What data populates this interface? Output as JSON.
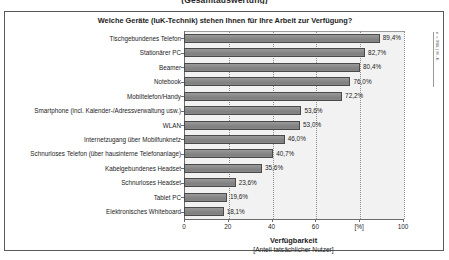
{
  "page": {
    "cut_off_heading": "(Gesamtauswertung)"
  },
  "side_note": "n = 986 | H.-K.",
  "axis_caption": {
    "main": "Verfügbarkeit",
    "sub": "[Anteil tatsächlicher Nutzer]"
  },
  "chart_data": {
    "type": "bar",
    "orientation": "horizontal",
    "title": "Welche Geräte (IuK-Technik) stehen Ihnen für Ihre Arbeit zur Verfügung?",
    "xlabel": "Verfügbarkeit",
    "xlabel_sub": "[Anteil tatsächlicher Nutzer]",
    "ylabel": "",
    "xlim": [
      0,
      100
    ],
    "xticks": [
      0,
      20,
      40,
      60,
      80,
      100
    ],
    "xtick_labels": [
      "0",
      "20",
      "40",
      "60",
      "[%]",
      "100"
    ],
    "grid": true,
    "legend": false,
    "unit": "%",
    "categories": [
      "Tischgebundenes Telefon",
      "Stationärer PC",
      "Beamer",
      "Notebook",
      "Mobiltelefon/Handy",
      "Smartphone (incl. Kalender-/Adressverwaltung usw.)",
      "WLAN",
      "Internetzugang über Mobilfunknetz",
      "Schnurloses Telefon (über hausinterne Telefonanlage)",
      "Kabelgebundenes Headset",
      "Schnurloses Headset",
      "Tablet PC",
      "Elektronisches Whiteboard"
    ],
    "values": [
      89.4,
      82.7,
      80.4,
      76.0,
      72.2,
      53.6,
      53.0,
      46.0,
      40.7,
      35.6,
      23.6,
      19.6,
      18.1
    ],
    "value_labels": [
      "89,4%",
      "82,7%",
      "80,4%",
      "76,0%",
      "72,2%",
      "53,6%",
      "53,0%",
      "46,0%",
      "40,7%",
      "35,6%",
      "23,6%",
      "19,6%",
      "18,1%"
    ],
    "bar_color": "#8a8a8a",
    "bar_border_color": "#4a4a4a",
    "plot_background": "#f2f2f2"
  }
}
